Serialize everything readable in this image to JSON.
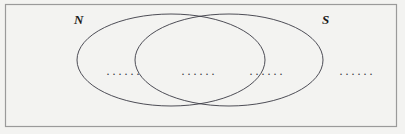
{
  "figure": {
    "type": "venn-diagram",
    "width": 405,
    "height": 134,
    "background_color": "#f3f3f1",
    "border_color": "#9a9a9a",
    "stroke_color": "#3a3a44"
  },
  "universe": {
    "name": "universal-set-rectangle",
    "label": ""
  },
  "sets": [
    {
      "id": "N",
      "label": "N",
      "shape": "ellipse",
      "cx": 171,
      "cy": 60,
      "rx": 94,
      "ry": 46
    },
    {
      "id": "S",
      "label": "S",
      "shape": "ellipse",
      "cx": 229,
      "cy": 60,
      "rx": 94,
      "ry": 46
    }
  ],
  "regions": [
    {
      "id": "n-only",
      "name": "N minus S",
      "content": "······"
    },
    {
      "id": "intersection",
      "name": "N intersect S",
      "content": "······"
    },
    {
      "id": "s-only",
      "name": "S minus N",
      "content": "······"
    },
    {
      "id": "outside",
      "name": "outside N and S",
      "content": "······"
    }
  ]
}
